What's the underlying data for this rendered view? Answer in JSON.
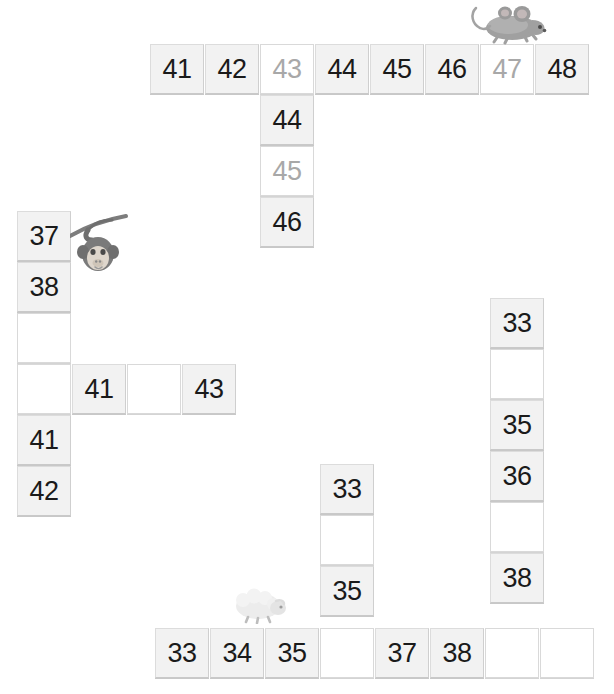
{
  "page": {
    "background_color": "#ffffff",
    "filled_cell_color": "#f2f2f2",
    "blank_cell_color": "#ffffff",
    "filled_text_color": "#1a1a1a",
    "ghost_text_color": "#a8a8a8",
    "border_color": "#d6d6d6"
  },
  "grid": {
    "cell_width": 54,
    "cell_height": 50,
    "groups": [
      {
        "name": "top-row",
        "orientation": "horizontal",
        "x": 150,
        "y": 44,
        "step": 55,
        "cells": [
          {
            "value": "41",
            "state": "filled"
          },
          {
            "value": "42",
            "state": "filled"
          },
          {
            "value": "43",
            "state": "ghost"
          },
          {
            "value": "44",
            "state": "filled"
          },
          {
            "value": "45",
            "state": "filled"
          },
          {
            "value": "46",
            "state": "filled"
          },
          {
            "value": "47",
            "state": "ghost"
          },
          {
            "value": "48",
            "state": "filled"
          }
        ]
      },
      {
        "name": "upper-middle-column",
        "orientation": "vertical",
        "x": 260,
        "y": 95,
        "step": 51,
        "cells": [
          {
            "value": "44",
            "state": "filled"
          },
          {
            "value": "45",
            "state": "ghost"
          },
          {
            "value": "46",
            "state": "filled"
          }
        ]
      },
      {
        "name": "left-column",
        "orientation": "vertical",
        "x": 17,
        "y": 211,
        "step": 51,
        "cells": [
          {
            "value": "37",
            "state": "filled"
          },
          {
            "value": "38",
            "state": "filled"
          },
          {
            "value": "",
            "state": "blank"
          },
          {
            "value": "",
            "state": "blank"
          },
          {
            "value": "41",
            "state": "filled"
          },
          {
            "value": "42",
            "state": "filled"
          }
        ]
      },
      {
        "name": "left-cross-row",
        "orientation": "horizontal",
        "x": 72,
        "y": 364,
        "step": 55,
        "cells": [
          {
            "value": "41",
            "state": "filled"
          },
          {
            "value": "",
            "state": "blank"
          },
          {
            "value": "43",
            "state": "filled"
          }
        ]
      },
      {
        "name": "right-column",
        "orientation": "vertical",
        "x": 490,
        "y": 298,
        "step": 51,
        "cells": [
          {
            "value": "33",
            "state": "filled"
          },
          {
            "value": "",
            "state": "blank"
          },
          {
            "value": "35",
            "state": "filled"
          },
          {
            "value": "36",
            "state": "filled"
          },
          {
            "value": "",
            "state": "blank"
          },
          {
            "value": "38",
            "state": "filled"
          }
        ]
      },
      {
        "name": "lower-middle-column",
        "orientation": "vertical",
        "x": 320,
        "y": 464,
        "step": 51,
        "cells": [
          {
            "value": "33",
            "state": "filled"
          },
          {
            "value": "",
            "state": "blank"
          },
          {
            "value": "35",
            "state": "filled"
          }
        ]
      },
      {
        "name": "bottom-row",
        "orientation": "horizontal",
        "x": 155,
        "y": 628,
        "step": 55,
        "cells": [
          {
            "value": "33",
            "state": "filled"
          },
          {
            "value": "34",
            "state": "filled"
          },
          {
            "value": "35",
            "state": "filled"
          },
          {
            "value": "",
            "state": "blank"
          },
          {
            "value": "37",
            "state": "filled"
          },
          {
            "value": "38",
            "state": "filled"
          },
          {
            "value": "",
            "state": "blank"
          },
          {
            "value": "",
            "state": "blank"
          }
        ]
      }
    ]
  },
  "critters": [
    {
      "name": "mouse-illustration",
      "label": "mouse",
      "x": 468,
      "y": 2,
      "width": 82,
      "height": 44,
      "body_color": "#9a9a9a",
      "shade_color": "#c4c4c4"
    },
    {
      "name": "monkey-illustration",
      "label": "monkey hanging from branch",
      "x": 70,
      "y": 212,
      "width": 62,
      "height": 68,
      "body_color": "#8d8d8d",
      "shade_color": "#d9d3cc"
    },
    {
      "name": "sheep-illustration",
      "label": "sheep",
      "x": 232,
      "y": 586,
      "width": 56,
      "height": 38,
      "body_color": "#e2e2e2",
      "shade_color": "#f2f2f2"
    }
  ]
}
